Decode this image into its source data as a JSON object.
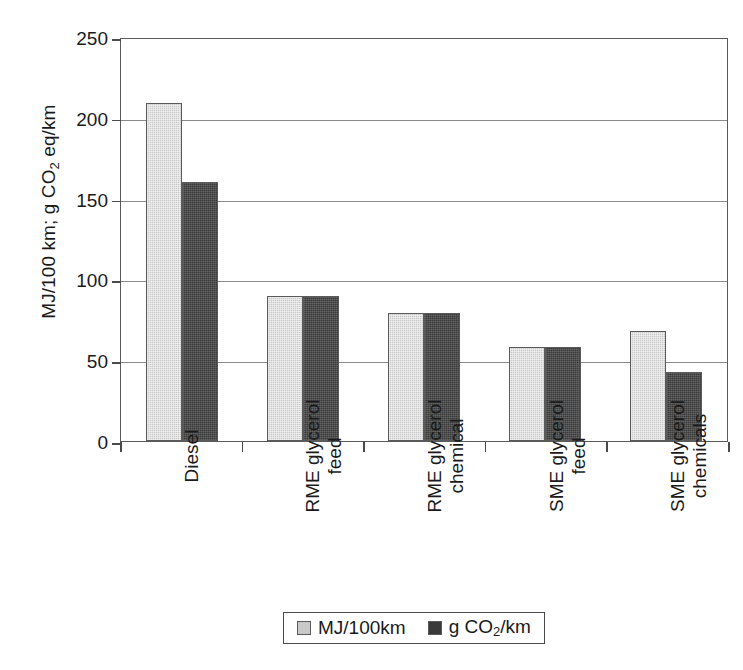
{
  "chart_data": {
    "type": "bar",
    "title": "",
    "xlabel": "",
    "ylabel": "MJ/100 km; g CO2 eq/km",
    "ylim": [
      0,
      250
    ],
    "yticks": [
      0,
      50,
      100,
      150,
      200,
      250
    ],
    "grid": true,
    "legend_position": "bottom",
    "categories": [
      "Diesel",
      "RME glycerol feed",
      "RME glycerol chemical",
      "SME glycerol feed",
      "SME glycerol chemicals"
    ],
    "series": [
      {
        "name": "MJ/100km",
        "color": "#c9c9c9",
        "values": [
          209,
          90,
          79,
          58,
          68
        ]
      },
      {
        "name": "g CO2/km",
        "color": "#3a3a3a",
        "values": [
          160,
          90,
          79,
          58,
          43
        ]
      }
    ]
  },
  "axis": {
    "y_title_part1": "MJ/100 km; g CO",
    "y_title_sub": "2",
    "y_title_part2": " eq/km",
    "tick_labels": [
      "250",
      "200",
      "150",
      "100",
      "50",
      "0"
    ]
  },
  "categories": [
    {
      "line1": "Diesel",
      "line2": ""
    },
    {
      "line1": "RME glycerol",
      "line2": "feed"
    },
    {
      "line1": "RME glycerol",
      "line2": "chemical"
    },
    {
      "line1": "SME glycerol",
      "line2": "feed"
    },
    {
      "line1": "SME glycerol",
      "line2": "chemicals"
    }
  ],
  "legend": [
    {
      "label_part1": "MJ/100km",
      "label_sub": "",
      "label_part2": "",
      "color": "#c9c9c9"
    },
    {
      "label_part1": "g CO",
      "label_sub": "2",
      "label_part2": "/km",
      "color": "#3a3a3a"
    }
  ]
}
